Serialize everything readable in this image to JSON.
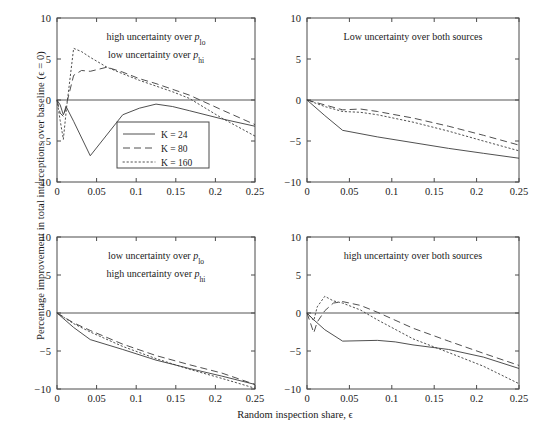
{
  "figure": {
    "ylabel": "Percentage improvement in total interceptions over baseline (ϵ = 0)",
    "xlabel": "Random inspection share, ϵ"
  },
  "legend": {
    "position": "top-left panel, lower-middle",
    "entries": [
      {
        "label": "K = 24",
        "style": "solid"
      },
      {
        "label": "K = 80",
        "style": "dashed"
      },
      {
        "label": "K = 160",
        "style": "dotted"
      }
    ]
  },
  "axis": {
    "xticks": [
      "0",
      "0.05",
      "0.1",
      "0.15",
      "0.2",
      "0.25"
    ],
    "xtickvals": [
      0,
      0.05,
      0.1,
      0.15,
      0.2,
      0.25
    ],
    "yticks": [
      "10",
      "5",
      "0",
      "−5",
      "−10"
    ],
    "ytickvals": [
      10,
      5,
      0,
      -5,
      -10
    ],
    "xlim": [
      0,
      0.25
    ],
    "ylim": [
      -10,
      10
    ]
  },
  "chart_data": {
    "type": "line",
    "title": "",
    "xlabel": "Random inspection share, ϵ",
    "ylabel": "Percentage improvement in total interceptions over baseline (ϵ = 0)",
    "xlim": [
      0,
      0.25
    ],
    "ylim": [
      -10,
      10
    ],
    "grid": false,
    "legend_position": "inside top-left panel",
    "panels": [
      {
        "id": "top-left",
        "title_lines": [
          "high uncertainty over p_lo",
          "low uncertainty over p_hi"
        ],
        "title_line1_plain": "high uncertainty over",
        "title_line1_sym": "p",
        "title_line1_sub": "lo",
        "title_line2_plain": "low uncertainty over",
        "title_line2_sym": "p",
        "title_line2_sub": "hi",
        "series": [
          {
            "name": "K = 24",
            "style": "solid",
            "x": [
              0,
              0.004,
              0.008,
              0.012,
              0.021,
              0.042,
              0.083,
              0.104,
              0.125,
              0.146,
              0.167,
              0.208,
              0.25
            ],
            "y": [
              0,
              -0.6,
              -1.8,
              -0.9,
              -2.6,
              -6.8,
              -1.8,
              -1.0,
              -0.5,
              -0.8,
              -1.3,
              -2.3,
              -3.2
            ]
          },
          {
            "name": "K = 80",
            "style": "dashed",
            "x": [
              0,
              0.004,
              0.008,
              0.012,
              0.021,
              0.031,
              0.042,
              0.063,
              0.083,
              0.104,
              0.125,
              0.146,
              0.167,
              0.208,
              0.25
            ],
            "y": [
              0,
              -1.6,
              -2.0,
              -0.5,
              3.0,
              3.6,
              3.5,
              4.0,
              3.4,
              2.6,
              2.0,
              1.3,
              0.6,
              -1.2,
              -3.0
            ]
          },
          {
            "name": "K = 160",
            "style": "dotted",
            "x": [
              0,
              0.004,
              0.008,
              0.012,
              0.021,
              0.031,
              0.042,
              0.063,
              0.083,
              0.104,
              0.125,
              0.146,
              0.167,
              0.208,
              0.25
            ],
            "y": [
              0,
              -2.5,
              -4.8,
              -1.0,
              6.3,
              5.9,
              5.2,
              4.0,
              3.2,
              2.4,
              1.7,
              1.0,
              0.2,
              -2.2,
              -4.4
            ]
          }
        ]
      },
      {
        "id": "top-right",
        "title_lines": [
          "Low uncertainty over both sources"
        ],
        "title_line1_plain": "Low uncertainty over both sources",
        "series": [
          {
            "name": "K = 24",
            "style": "solid",
            "x": [
              0,
              0.021,
              0.042,
              0.083,
              0.125,
              0.167,
              0.208,
              0.25
            ],
            "y": [
              0,
              -1.9,
              -3.7,
              -4.5,
              -5.2,
              -5.9,
              -6.5,
              -7.1
            ]
          },
          {
            "name": "K = 80",
            "style": "dashed",
            "x": [
              0,
              0.021,
              0.042,
              0.063,
              0.083,
              0.125,
              0.167,
              0.208,
              0.25
            ],
            "y": [
              0,
              -0.6,
              -1.2,
              -1.1,
              -1.4,
              -2.2,
              -3.2,
              -4.3,
              -5.5
            ]
          },
          {
            "name": "K = 160",
            "style": "dotted",
            "x": [
              0,
              0.021,
              0.042,
              0.063,
              0.083,
              0.125,
              0.167,
              0.208,
              0.25
            ],
            "y": [
              0,
              -0.8,
              -1.4,
              -1.5,
              -1.8,
              -2.7,
              -3.8,
              -5.0,
              -6.2
            ]
          }
        ]
      },
      {
        "id": "bottom-left",
        "title_lines": [
          "low uncertainty over p_lo",
          "high uncertainty over p_hi"
        ],
        "title_line1_plain": "low uncertainty over",
        "title_line1_sym": "p",
        "title_line1_sub": "lo",
        "title_line2_plain": "high uncertainty over",
        "title_line2_sym": "p",
        "title_line2_sub": "hi",
        "series": [
          {
            "name": "K = 24",
            "style": "solid",
            "x": [
              0,
              0.021,
              0.042,
              0.083,
              0.125,
              0.167,
              0.208,
              0.25
            ],
            "y": [
              0,
              -1.9,
              -3.5,
              -4.8,
              -6.2,
              -7.3,
              -8.3,
              -9.4
            ]
          },
          {
            "name": "K = 80",
            "style": "dashed",
            "x": [
              0,
              0.021,
              0.042,
              0.083,
              0.125,
              0.167,
              0.208,
              0.25
            ],
            "y": [
              0,
              -1.3,
              -2.3,
              -4.1,
              -5.6,
              -6.8,
              -7.9,
              -9.4
            ]
          },
          {
            "name": "K = 160",
            "style": "dotted",
            "x": [
              0,
              0.021,
              0.042,
              0.083,
              0.125,
              0.167,
              0.208,
              0.25
            ],
            "y": [
              0,
              -1.4,
              -2.5,
              -4.4,
              -6.0,
              -7.4,
              -8.6,
              -9.9
            ]
          }
        ]
      },
      {
        "id": "bottom-right",
        "title_lines": [
          "high uncertainty over both sources"
        ],
        "title_line1_plain": "high uncertainty over both sources",
        "series": [
          {
            "name": "K = 24",
            "style": "solid",
            "x": [
              0,
              0.008,
              0.021,
              0.042,
              0.083,
              0.104,
              0.125,
              0.167,
              0.208,
              0.25
            ],
            "y": [
              0,
              -0.9,
              -2.2,
              -3.7,
              -3.6,
              -3.8,
              -4.2,
              -4.8,
              -5.8,
              -7.3
            ]
          },
          {
            "name": "K = 80",
            "style": "dashed",
            "x": [
              0,
              0.008,
              0.012,
              0.021,
              0.031,
              0.042,
              0.063,
              0.083,
              0.125,
              0.167,
              0.208,
              0.25
            ],
            "y": [
              0,
              -2.6,
              -1.2,
              0.3,
              1.3,
              1.5,
              1.0,
              0.1,
              -2.0,
              -3.7,
              -5.3,
              -6.9
            ]
          },
          {
            "name": "K = 160",
            "style": "dotted",
            "x": [
              0,
              0.008,
              0.012,
              0.021,
              0.031,
              0.042,
              0.063,
              0.083,
              0.125,
              0.167,
              0.208,
              0.25
            ],
            "y": [
              0,
              -1.0,
              0.8,
              2.2,
              1.6,
              1.3,
              0.4,
              -0.9,
              -3.4,
              -5.2,
              -7.0,
              -9.3
            ]
          }
        ]
      }
    ]
  }
}
